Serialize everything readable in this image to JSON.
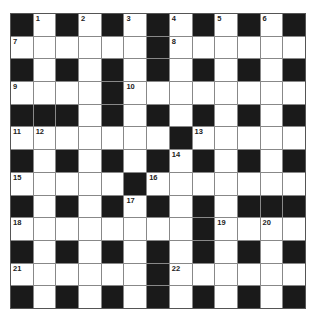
{
  "puzzle": {
    "rows": 13,
    "cols": 13,
    "grid": [
      "#.#.#.#.#.#.#",
      "......#......",
      "#.#.#.#.#.#.#",
      "....#........",
      "###.#.#.#.#.#",
      ".......#.....",
      "#.#.#.#.#.#.#",
      ".....#.......",
      "#.#.#.#.#.###",
      "........#....",
      "#.#.#.#.#.#.#",
      "......#......",
      "#.#.#.#.#.#.#"
    ],
    "numbers": [
      {
        "n": "1",
        "r": 0,
        "c": 1
      },
      {
        "n": "2",
        "r": 0,
        "c": 3
      },
      {
        "n": "3",
        "r": 0,
        "c": 5
      },
      {
        "n": "4",
        "r": 0,
        "c": 7
      },
      {
        "n": "5",
        "r": 0,
        "c": 9
      },
      {
        "n": "6",
        "r": 0,
        "c": 11
      },
      {
        "n": "7",
        "r": 1,
        "c": 0
      },
      {
        "n": "8",
        "r": 1,
        "c": 7
      },
      {
        "n": "9",
        "r": 3,
        "c": 0
      },
      {
        "n": "10",
        "r": 3,
        "c": 5
      },
      {
        "n": "11",
        "r": 5,
        "c": 0
      },
      {
        "n": "12",
        "r": 5,
        "c": 1
      },
      {
        "n": "13",
        "r": 5,
        "c": 8
      },
      {
        "n": "14",
        "r": 6,
        "c": 7
      },
      {
        "n": "15",
        "r": 7,
        "c": 0
      },
      {
        "n": "16",
        "r": 7,
        "c": 6
      },
      {
        "n": "17",
        "r": 8,
        "c": 5
      },
      {
        "n": "18",
        "r": 9,
        "c": 0
      },
      {
        "n": "19",
        "r": 9,
        "c": 9
      },
      {
        "n": "20",
        "r": 9,
        "c": 11
      },
      {
        "n": "21",
        "r": 11,
        "c": 0
      },
      {
        "n": "22",
        "r": 11,
        "c": 7
      }
    ]
  },
  "colors": {
    "block": "#1a1a1a",
    "cell": "#ffffff",
    "gridline": "#888888"
  }
}
